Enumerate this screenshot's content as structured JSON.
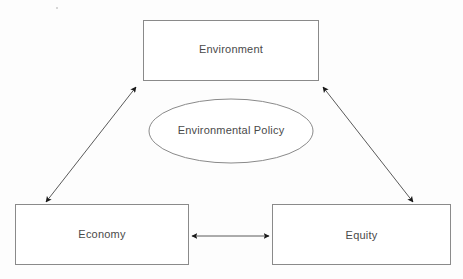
{
  "diagram": {
    "type": "triangle-relationship-diagram",
    "background_color": "#fdfdfd",
    "stroke_color": "#8a8a8a",
    "arrow_color": "#1a1a1a",
    "text_color": "#4a4a4a",
    "nodes": [
      {
        "id": "environment",
        "label": "Environment",
        "shape": "rectangle",
        "x": 143,
        "y": 20,
        "width": 176,
        "height": 61
      },
      {
        "id": "environmental-policy",
        "label": "Environmental Policy",
        "shape": "ellipse",
        "cx": 231,
        "cy": 131,
        "rx": 82,
        "ry": 32
      },
      {
        "id": "economy",
        "label": "Economy",
        "shape": "rectangle",
        "x": 15,
        "y": 204,
        "width": 174,
        "height": 61
      },
      {
        "id": "equity",
        "label": "Equity",
        "shape": "rectangle",
        "x": 272,
        "y": 204,
        "width": 179,
        "height": 61
      }
    ],
    "connectors": [
      {
        "id": "economy-environment",
        "from": "economy",
        "to": "environment",
        "style": "double-headed-arrow",
        "x1": 45,
        "y1": 203,
        "x2": 137,
        "y2": 86
      },
      {
        "id": "environment-equity",
        "from": "environment",
        "to": "equity",
        "style": "double-headed-arrow",
        "x1": 322,
        "y1": 86,
        "x2": 414,
        "y2": 203
      },
      {
        "id": "economy-equity",
        "from": "economy",
        "to": "equity",
        "style": "double-headed-arrow",
        "x1": 191,
        "y1": 236,
        "x2": 270,
        "y2": 236
      }
    ]
  }
}
